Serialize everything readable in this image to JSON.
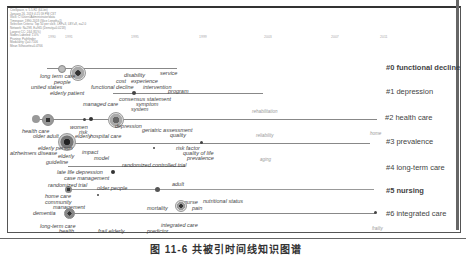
{
  "header_info": [
    "CiteSpace, v. 5.5.R2 (64-bit)",
    "January 26, 2019 4:21:59 PM CST",
    "WoS: C:\\Users\\Administrator\\data",
    "Timespan: 1990-2018 (Slice Length=1)",
    "Selection Criteria: Top 50 per slice, LRF=3, LBY=8, e=2.0",
    "Network: N=298, E=965 (Density=0.0218)",
    "Largest CC: 244 (81%)",
    "Nodes Labeled: 1.0%",
    "Pruning: Pathfinder",
    "Modularity Q=0.7106",
    "Mean Silhouette=0.4766"
  ],
  "years": [
    "1990",
    "1991",
    "1995",
    "1999",
    "2003",
    "2007",
    "2011"
  ],
  "clusters": [
    {
      "id": "#0",
      "label": "#0 functional decline"
    },
    {
      "id": "#1",
      "label": "#1 depression"
    },
    {
      "id": "#2",
      "label": "#2 health care"
    },
    {
      "id": "#3",
      "label": "#3 prevalence"
    },
    {
      "id": "#4",
      "label": "#4 long-term care"
    },
    {
      "id": "#5",
      "label": "#5 nursing"
    },
    {
      "id": "#6",
      "label": "#6 integrated care"
    }
  ],
  "keywords": {
    "c0": [
      "long term care",
      "people",
      "united states",
      "elderly patient",
      "disability",
      "cost",
      "experience",
      "service",
      "functional decline",
      "intervention"
    ],
    "c1": [
      "program",
      "consensus statement",
      "managed care",
      "symptom",
      "system",
      "rehabilitation"
    ],
    "c2": [
      "health care",
      "older adult",
      "women",
      "risk",
      "elderly",
      "hospital care",
      "depression",
      "geriatric assessment",
      "quality",
      "reliability",
      "home"
    ],
    "c3": [
      "elderly person",
      "alzheimers disease",
      "elderly",
      "guideline",
      "impact",
      "model",
      "risk factor",
      "quality of life",
      "prevalence",
      "aging"
    ],
    "c4": [
      "randomized controlled trial",
      "late life depression",
      "case management"
    ],
    "c5": [
      "randomized trial",
      "older people",
      "adult",
      "home care",
      "community",
      "management",
      "nurse",
      "pain",
      "mortality",
      "nutritional status"
    ],
    "c6": [
      "dementia",
      "long-term care",
      "health",
      "frail elderly",
      "integrated care",
      "predictor",
      "frailty"
    ]
  },
  "caption": "图 11-6   共被引时间线知识图谱"
}
